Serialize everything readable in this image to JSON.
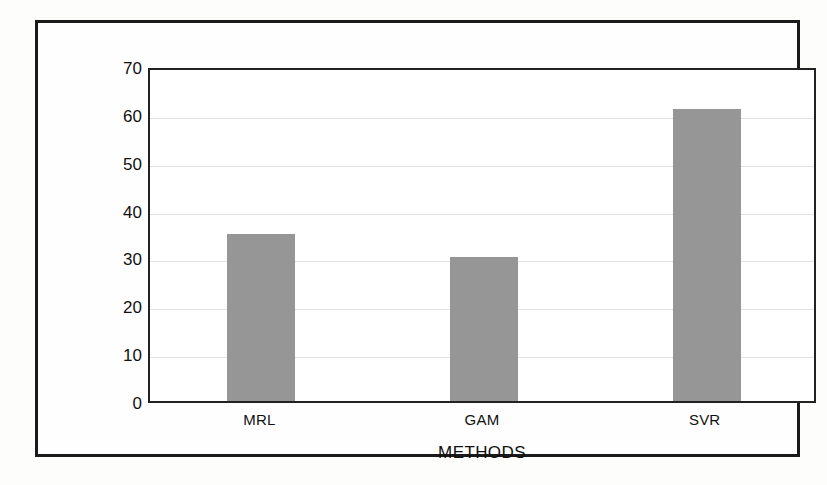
{
  "chart_data": {
    "type": "bar",
    "title": "",
    "xlabel": "METHODS",
    "ylabel": "EXPLAINED VARIANCE (%)",
    "categories": [
      "MRL",
      "GAM",
      "SVR"
    ],
    "values": [
      35,
      30,
      61
    ],
    "ylim": [
      0,
      70
    ],
    "yticks": [
      0,
      10,
      20,
      30,
      40,
      50,
      60,
      70
    ],
    "ytick_labels": [
      "0",
      "10",
      "20",
      "30",
      "40",
      "50",
      "60",
      "70"
    ],
    "grid": true,
    "legend": false,
    "bar_color": "#969696",
    "axis_color": "#222222",
    "grid_color": "#e2e2e2"
  },
  "figure": {
    "frame_color": "#1a1a1a",
    "background": "#fefefe"
  }
}
